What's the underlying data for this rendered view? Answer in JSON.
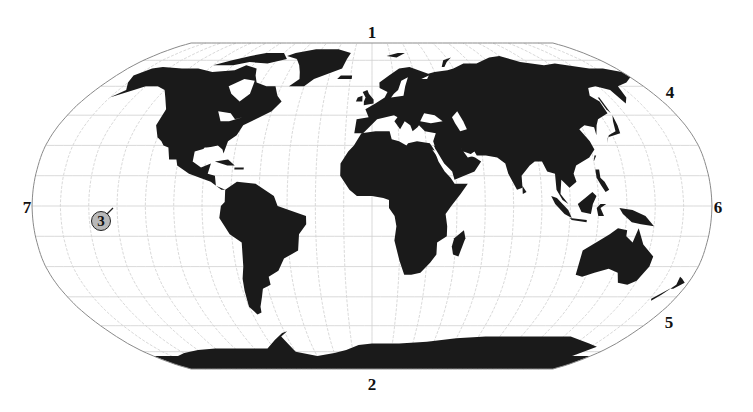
{
  "map": {
    "projection": "Robinson",
    "background_color": "#ffffff",
    "land_color": "#1a1a1a",
    "grid_color": "#cfcfcf",
    "border_color": "#8a8a8a",
    "graticule_step_deg": 15,
    "center_x": 372,
    "center_y": 206,
    "half_width": 340,
    "half_height": 163
  },
  "labels": [
    {
      "id": "1",
      "text": "1",
      "x": 372,
      "y": 32,
      "position": "top"
    },
    {
      "id": "2",
      "text": "2",
      "x": 372,
      "y": 384,
      "position": "bottom"
    },
    {
      "id": "4",
      "text": "4",
      "x": 670,
      "y": 92,
      "position": "upper-right"
    },
    {
      "id": "5",
      "text": "5",
      "x": 669,
      "y": 322,
      "position": "lower-right"
    },
    {
      "id": "6",
      "text": "6",
      "x": 718,
      "y": 207,
      "position": "right"
    },
    {
      "id": "7",
      "text": "7",
      "x": 27,
      "y": 207,
      "position": "left"
    }
  ],
  "marker": {
    "text": "3",
    "x": 101,
    "y": 221,
    "fill": "#b8b8b8",
    "pointer_to": {
      "x": 113,
      "y": 208
    }
  }
}
